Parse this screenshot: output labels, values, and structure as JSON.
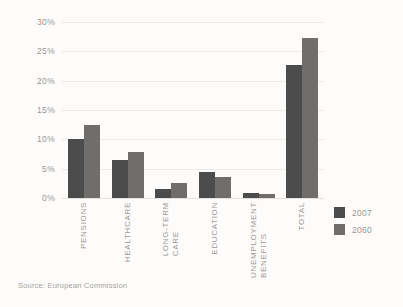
{
  "chart_data": {
    "type": "bar",
    "title": "",
    "xlabel": "",
    "ylabel": "",
    "categories": [
      "PENSIONS",
      "HEALTHCARE",
      "LONG-TERM\nCARE",
      "EDUCATION",
      "UNEMPLOYMENT\nBENEFITS",
      "TOTAL"
    ],
    "series": [
      {
        "name": "2007",
        "color": "#4c4c4c",
        "values": [
          10.0,
          6.4,
          1.5,
          4.5,
          0.8,
          22.7
        ]
      },
      {
        "name": "2060",
        "color": "#6f6e6c",
        "values": [
          12.5,
          7.8,
          2.5,
          3.6,
          0.7,
          27.2
        ]
      }
    ],
    "ylim": [
      0,
      30
    ],
    "yticks": [
      "0%",
      "5%",
      "10%",
      "15%",
      "20%",
      "25%",
      "30%"
    ],
    "ytick_values": [
      0,
      5,
      10,
      15,
      20,
      25,
      30
    ],
    "grid": true,
    "legend_position": "right"
  },
  "legend": {
    "entries": [
      {
        "label": "2007"
      },
      {
        "label": "2060"
      }
    ]
  },
  "source": {
    "text": "Source: European Commission"
  },
  "colors": {
    "background": "#fdfcfa",
    "gridline": "#eceae6",
    "text": "#9a9793",
    "series_2007": "#4c4c4c",
    "series_2060": "#6f6e6c"
  }
}
